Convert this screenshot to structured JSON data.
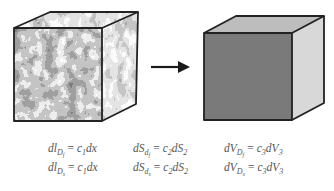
{
  "diagram": {
    "arrow": {
      "direction": "right",
      "color": "#1a1a1a"
    },
    "left_cube": {
      "label": "textured-cube",
      "face": "mottled-black-white",
      "edge_color": "#222222"
    },
    "right_cube": {
      "label": "homogeneous-cube",
      "front_color": "#7a7a7a",
      "top_color": "#bdbdbd",
      "side_color": "#d8d8d8",
      "edge_color": "#222222"
    }
  },
  "equations": {
    "row1": {
      "eq1": {
        "lhs": "dl",
        "sub": "D",
        "subsub": "f",
        "rhs_coef": "c",
        "rhs_coef_sub": "1",
        "rhs_var": "dx"
      },
      "eq2": {
        "lhs": "dS",
        "sub": "d",
        "subsub": "f",
        "rhs_coef": "c",
        "rhs_coef_sub": "2",
        "rhs_var": "dS",
        "rhs_var_sub": "2"
      },
      "eq3": {
        "lhs": "dV",
        "sub": "D",
        "subsub": "f",
        "rhs_coef": "c",
        "rhs_coef_sub": "3",
        "rhs_var": "dV",
        "rhs_var_sub": "3"
      }
    },
    "row2": {
      "eq1": {
        "lhs": "dl",
        "sub": "D",
        "subsub": "s",
        "rhs_coef": "c",
        "rhs_coef_sub": "1",
        "rhs_var": "dx"
      },
      "eq2": {
        "lhs": "dS",
        "sub": "d",
        "subsub": "s",
        "rhs_coef": "c",
        "rhs_coef_sub": "2",
        "rhs_var": "dS",
        "rhs_var_sub": "2"
      },
      "eq3": {
        "lhs": "dV",
        "sub": "D",
        "subsub": "s",
        "rhs_coef": "c",
        "rhs_coef_sub": "3",
        "rhs_var": "dV",
        "rhs_var_sub": "3"
      }
    },
    "equals": "="
  }
}
